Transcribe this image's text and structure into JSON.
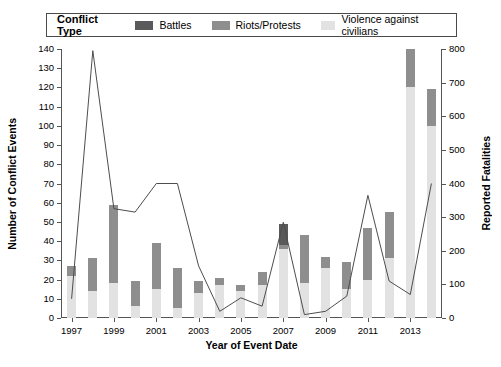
{
  "legend": {
    "title": "Conflict Type",
    "entries": [
      {
        "label": "Battles",
        "color": "#5a5a5a"
      },
      {
        "label": "Riots/Protests",
        "color": "#8e8e8e"
      },
      {
        "label": "Violence against civilians",
        "color": "#e2e2e2"
      }
    ]
  },
  "axes": {
    "xlabel": "Year of Event Date",
    "ylabel_left": "Number of Conflict Events",
    "ylabel_right": "Reported Fatalities"
  },
  "chart_data": {
    "type": "bar",
    "title": "",
    "xlabel": "Year of Event Date",
    "ylabel": "Number of Conflict Events",
    "ylabel_secondary": "Reported Fatalities",
    "grid": false,
    "legend_position": "top",
    "stacked": true,
    "categories": [
      1997,
      1998,
      1999,
      2000,
      2001,
      2002,
      2003,
      2004,
      2005,
      2006,
      2007,
      2008,
      2009,
      2010,
      2011,
      2012,
      2013,
      2014
    ],
    "xticklabels": [
      "1997",
      "1999",
      "2001",
      "2003",
      "2005",
      "2007",
      "2009",
      "2011",
      "2013"
    ],
    "xtick_years": [
      1997,
      1999,
      2001,
      2003,
      2005,
      2007,
      2009,
      2011,
      2013
    ],
    "ylim": [
      0,
      140
    ],
    "yticks": [
      0,
      10,
      20,
      30,
      40,
      50,
      60,
      70,
      80,
      90,
      100,
      110,
      120,
      130,
      140
    ],
    "ylim_secondary": [
      0,
      800
    ],
    "yticks_secondary": [
      0,
      100,
      200,
      300,
      400,
      500,
      600,
      700,
      800
    ],
    "series": [
      {
        "name": "Violence against civilians",
        "color": "#e2e2e2",
        "values": [
          22,
          14,
          18,
          6,
          15,
          5,
          13,
          17,
          14,
          17,
          36,
          18,
          26,
          15,
          20,
          31,
          120,
          100
        ]
      },
      {
        "name": "Riots/Protests",
        "color": "#8e8e8e",
        "values": [
          5,
          17,
          41,
          13,
          24,
          21,
          6,
          4,
          3,
          7,
          2,
          25,
          6,
          14,
          27,
          24,
          20,
          19
        ]
      },
      {
        "name": "Battles",
        "color": "#5a5a5a",
        "values": [
          0,
          0,
          0,
          0,
          0,
          0,
          0,
          0,
          0,
          0,
          11,
          0,
          0,
          0,
          0,
          0,
          0,
          0
        ]
      }
    ],
    "bar_totals": [
      27,
      31,
      59,
      19,
      39,
      26,
      19,
      21,
      17,
      24,
      49,
      43,
      32,
      29,
      47,
      55,
      140,
      119
    ],
    "line": {
      "name": "Reported Fatalities",
      "color": "#4d4d4d",
      "axis": "secondary",
      "x": [
        1997,
        1998,
        1999,
        2000,
        2001,
        2002,
        2003,
        2004,
        2005,
        2006,
        2007,
        2008,
        2009,
        2010,
        2011,
        2012,
        2013,
        2014
      ],
      "values": [
        57,
        795,
        325,
        315,
        400,
        400,
        155,
        20,
        60,
        35,
        285,
        10,
        20,
        65,
        365,
        110,
        70,
        400
      ]
    }
  }
}
